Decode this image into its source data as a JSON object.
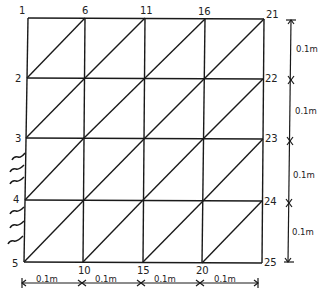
{
  "diagram": {
    "type": "finite-element-mesh",
    "grid": {
      "columns": 4,
      "rows": 4,
      "cell_size": "0.1m"
    },
    "nodes": {
      "top_row": [
        "1",
        "6",
        "11",
        "16",
        "21"
      ],
      "left_column": [
        "1",
        "2",
        "3",
        "4",
        "5"
      ],
      "right_column": [
        "21",
        "22",
        "23",
        "24",
        "25"
      ],
      "bottom_row": [
        "5",
        "10",
        "15",
        "20",
        "25"
      ]
    },
    "node_labels": {
      "n1": "1",
      "n2": "2",
      "n3": "3",
      "n4": "4",
      "n5": "5",
      "n6": "6",
      "n10": "10",
      "n11": "11",
      "n15": "15",
      "n16": "16",
      "n20": "20",
      "n21": "21",
      "n22": "22",
      "n23": "23",
      "n24": "24",
      "n25": "25"
    },
    "dimensions": {
      "right": [
        "0.1m",
        "0.1m",
        "0.1m",
        "0.1m"
      ],
      "bottom": [
        "0.1m",
        "0.1m",
        "0.1m",
        "0.1m"
      ]
    },
    "support": {
      "edge": "left",
      "from_node": "3",
      "to_node": "5",
      "style": "hatched"
    },
    "line_color": "#1a1a1a"
  }
}
